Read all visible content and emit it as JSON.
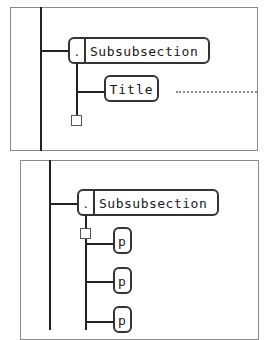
{
  "panels": [
    {
      "node": {
        "toggle": ".",
        "label": "Subsubsection"
      },
      "children": [
        {
          "label": "Title"
        }
      ],
      "has_dotted_continuation": true,
      "placeholder_square": true
    },
    {
      "node": {
        "toggle": ".",
        "label": "Subsubsection"
      },
      "children": [
        {
          "label": "p"
        },
        {
          "label": "p"
        },
        {
          "label": "p"
        }
      ],
      "placeholder_square": true
    }
  ],
  "colors": {
    "line": "#222222",
    "border": "#8a8a8a",
    "background": "#ffffff"
  }
}
